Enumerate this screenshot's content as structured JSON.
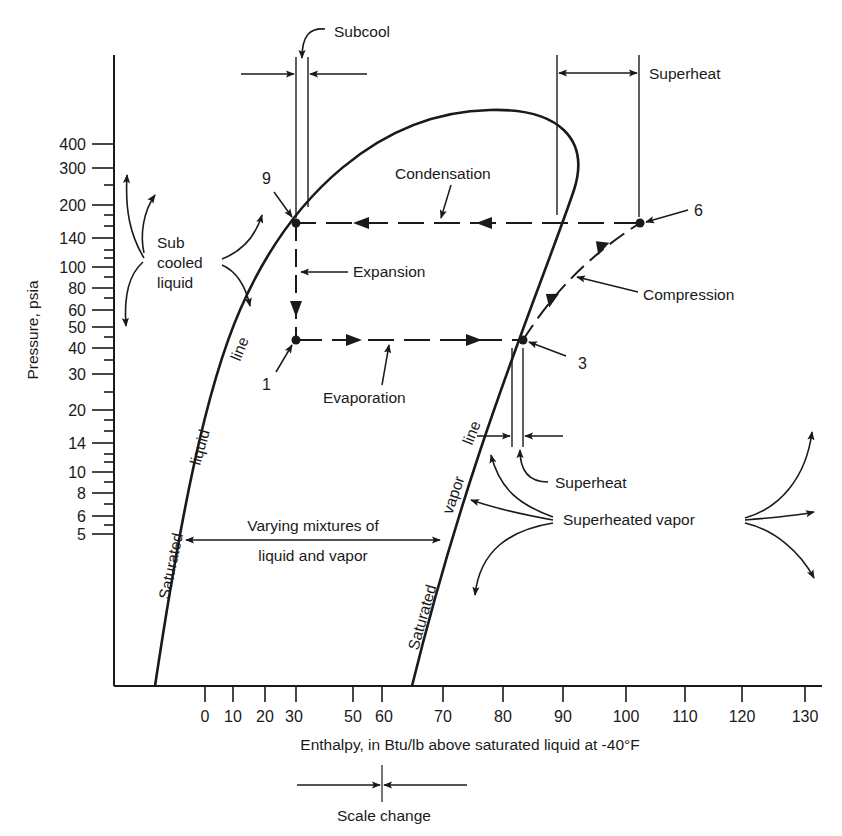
{
  "diagram": {
    "type": "pressure-enthalpy refrigeration cycle diagram",
    "y_axis": {
      "label": "Pressure, psia",
      "ticks": [
        "400",
        "300",
        "200",
        "140",
        "100",
        "80",
        "60",
        "50",
        "40",
        "30",
        "20",
        "14",
        "10",
        "8",
        "6",
        "5"
      ]
    },
    "x_axis": {
      "label": "Enthalpy, in Btu/lb above saturated liquid at -40°F",
      "ticks": [
        "0",
        "10",
        "20",
        "30",
        "50",
        "60",
        "70",
        "80",
        "90",
        "100",
        "110",
        "120",
        "130"
      ],
      "scale_change_label": "Scale change"
    },
    "curves": {
      "liquid_line": [
        "Saturated",
        "liquid",
        "line"
      ],
      "vapor_line": [
        "Saturated",
        "vapor",
        "line"
      ]
    },
    "labels": {
      "subcool": "Subcool",
      "superheat_top": "Superheat",
      "superheat_bottom": "Superheat",
      "condensation": "Condensation",
      "expansion": "Expansion",
      "evaporation": "Evaporation",
      "compression": "Compression",
      "subcooled_liquid": [
        "Sub",
        "cooled",
        "liquid"
      ],
      "mixture": [
        "Varying mixtures of",
        "liquid and vapor"
      ],
      "superheated_vapor": "Superheated vapor"
    },
    "points": [
      {
        "id": "9",
        "label": "9",
        "pressure": 160,
        "enthalpy": 30
      },
      {
        "id": "1",
        "label": "1",
        "pressure": 45,
        "enthalpy": 30
      },
      {
        "id": "3",
        "label": "3",
        "pressure": 45,
        "enthalpy": 83
      },
      {
        "id": "6",
        "label": "6",
        "pressure": 160,
        "enthalpy": 102
      }
    ]
  }
}
